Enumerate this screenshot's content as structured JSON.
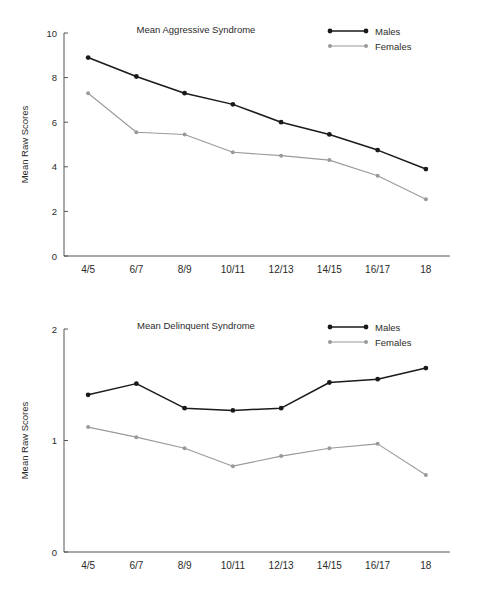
{
  "figure": {
    "background": "#ffffff",
    "series_colors": {
      "males": "#1a1a1a",
      "females": "#9a9a9a"
    }
  },
  "chart_data": [
    {
      "type": "line",
      "id": "mean-aggressive-syndrome",
      "title": "Mean Aggressive Syndrome",
      "xlabel": "",
      "ylabel": "Mean Raw Scores",
      "categories": [
        "4/5",
        "6/7",
        "8/9",
        "10/11",
        "12/13",
        "14/15",
        "16/17",
        "18"
      ],
      "yticks": [
        "0",
        "2",
        "4",
        "6",
        "8",
        "10"
      ],
      "ytick_values": [
        0,
        2,
        4,
        6,
        8,
        10
      ],
      "ylim": [
        0,
        10
      ],
      "grid": false,
      "legend_position": "top-right",
      "series": [
        {
          "name": "Males",
          "color": "#1a1a1a",
          "values": [
            8.9,
            8.05,
            7.3,
            6.8,
            6.0,
            5.45,
            4.75,
            3.9
          ]
        },
        {
          "name": "Females",
          "color": "#9a9a9a",
          "values": [
            7.3,
            5.55,
            5.45,
            4.65,
            4.5,
            4.3,
            3.6,
            2.55
          ]
        }
      ]
    },
    {
      "type": "line",
      "id": "mean-delinquent-syndrome",
      "title": "Mean Delinquent Syndrome",
      "xlabel": "",
      "ylabel": "Mean Raw Scores",
      "categories": [
        "4/5",
        "6/7",
        "8/9",
        "10/11",
        "12/13",
        "14/15",
        "16/17",
        "18"
      ],
      "yticks": [
        "0",
        "1",
        "2"
      ],
      "ytick_values": [
        0,
        1,
        2
      ],
      "ylim": [
        0,
        2
      ],
      "grid": false,
      "legend_position": "top-right",
      "series": [
        {
          "name": "Males",
          "color": "#1a1a1a",
          "values": [
            1.41,
            1.51,
            1.29,
            1.27,
            1.29,
            1.52,
            1.55,
            1.65
          ]
        },
        {
          "name": "Females",
          "color": "#9a9a9a",
          "values": [
            1.12,
            1.03,
            0.93,
            0.77,
            0.86,
            0.93,
            0.97,
            0.69
          ]
        }
      ]
    }
  ]
}
